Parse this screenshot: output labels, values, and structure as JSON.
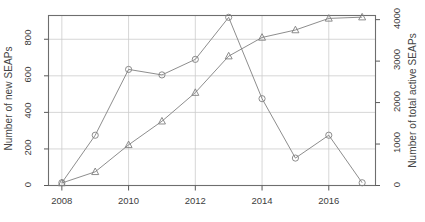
{
  "chart_data": {
    "type": "line",
    "title": "",
    "subtitle": "",
    "xlabel": "",
    "ylabel": "Number of new SEAPs",
    "ylabel_secondary": "Number of total active SEAPs",
    "x": [
      2008,
      2009,
      2010,
      2011,
      2012,
      2013,
      2014,
      2015,
      2016,
      2017
    ],
    "xlim": [
      2007.6,
      2017.4
    ],
    "xticks": [
      2008,
      2010,
      2012,
      2014,
      2016
    ],
    "xticklabels": [
      "2008",
      "2010",
      "2012",
      "2014",
      "2016"
    ],
    "ylim": [
      0,
      930
    ],
    "yticks": [
      0,
      200,
      400,
      600,
      800
    ],
    "yticklabels": [
      "0",
      "200",
      "400",
      "600",
      "800"
    ],
    "ylim_secondary": [
      0,
      4100
    ],
    "yticks_secondary": [
      0,
      1000,
      2000,
      3000,
      4000
    ],
    "yticklabels_secondary": [
      "0",
      "1000",
      "2000",
      "3000",
      "4000"
    ],
    "grid": true,
    "grid_color": "#cccccc",
    "legend": "none",
    "line_color": "#808080",
    "series": [
      {
        "name": "Number of new SEAPs",
        "marker": "circle",
        "axis": "left",
        "values": [
          15,
          275,
          635,
          605,
          690,
          920,
          475,
          150,
          275,
          15
        ]
      },
      {
        "name": "Number of total active SEAPs",
        "marker": "triangle",
        "axis": "right",
        "values": [
          60,
          330,
          980,
          1550,
          2240,
          3120,
          3570,
          3750,
          4030,
          4060
        ]
      }
    ]
  },
  "axes": {
    "left_title": "Number of new SEAPs",
    "right_title": "Number of total active SEAPs"
  }
}
